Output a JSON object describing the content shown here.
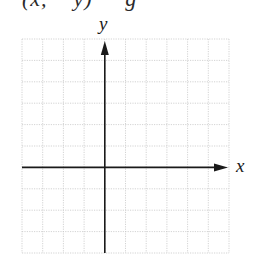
{
  "caption": {
    "text_partial": "(x,    y)     g",
    "clipped": true
  },
  "graph": {
    "type": "coordinate-grid",
    "x_label": "x",
    "y_label": "y",
    "grid": {
      "columns": 10,
      "rows": 10,
      "left": 22,
      "top": 39,
      "right": 229,
      "bottom": 253,
      "line_color": "#c8c8c8",
      "line_style": "dotted"
    },
    "axes": {
      "y_axis_column": 4,
      "x_axis_row": 6,
      "color": "#1a1a1a",
      "x_arrow": "right",
      "y_arrow": "up"
    }
  }
}
